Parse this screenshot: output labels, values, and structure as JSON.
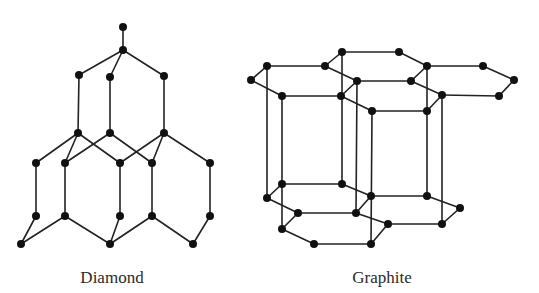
{
  "figure": {
    "colors": {
      "bond": "#222222",
      "atom": "#111111",
      "label": "#2a2a2a",
      "background": "#ffffff"
    },
    "atom_radius": 4,
    "panels": [
      {
        "id": "diamond",
        "label": "Diamond",
        "label_pos": [
          112,
          283
        ],
        "atoms": [
          [
            123,
            27
          ],
          [
            123,
            50
          ],
          [
            79,
            75
          ],
          [
            110,
            77
          ],
          [
            164,
            76
          ],
          [
            78,
            133
          ],
          [
            110,
            133
          ],
          [
            164,
            133
          ],
          [
            36,
            163
          ],
          [
            65,
            163
          ],
          [
            120,
            163
          ],
          [
            152,
            163
          ],
          [
            210,
            163
          ],
          [
            36,
            216
          ],
          [
            65,
            216
          ],
          [
            120,
            216
          ],
          [
            152,
            216
          ],
          [
            210,
            216
          ],
          [
            21,
            244
          ],
          [
            110,
            244
          ],
          [
            193,
            244
          ]
        ],
        "bonds": [
          [
            0,
            1
          ],
          [
            1,
            2
          ],
          [
            1,
            3
          ],
          [
            1,
            4
          ],
          [
            2,
            5
          ],
          [
            3,
            6
          ],
          [
            4,
            7
          ],
          [
            5,
            8
          ],
          [
            5,
            9
          ],
          [
            5,
            10
          ],
          [
            6,
            9
          ],
          [
            6,
            11
          ],
          [
            7,
            10
          ],
          [
            7,
            11
          ],
          [
            7,
            12
          ],
          [
            8,
            13
          ],
          [
            9,
            14
          ],
          [
            10,
            15
          ],
          [
            11,
            16
          ],
          [
            12,
            17
          ],
          [
            13,
            18
          ],
          [
            14,
            18
          ],
          [
            14,
            19
          ],
          [
            15,
            19
          ],
          [
            16,
            19
          ],
          [
            16,
            20
          ],
          [
            17,
            20
          ]
        ]
      },
      {
        "id": "graphite",
        "label": "Graphite",
        "label_pos": [
          382,
          283
        ],
        "atoms": [
          [
            251,
            80
          ],
          [
            267,
            66
          ],
          [
            325,
            66
          ],
          [
            342,
            52
          ],
          [
            399,
            52
          ],
          [
            427,
            66
          ],
          [
            483,
            66
          ],
          [
            514,
            80
          ],
          [
            357,
            81
          ],
          [
            411,
            81
          ],
          [
            282,
            96
          ],
          [
            341,
            96
          ],
          [
            442,
            95
          ],
          [
            499,
            96
          ],
          [
            372,
            111
          ],
          [
            427,
            111
          ],
          [
            282,
            184
          ],
          [
            342,
            184
          ],
          [
            371,
            196
          ],
          [
            427,
            196
          ],
          [
            460,
            208
          ],
          [
            267,
            198
          ],
          [
            298,
            213
          ],
          [
            356,
            213
          ],
          [
            388,
            224
          ],
          [
            442,
            224
          ],
          [
            282,
            229
          ],
          [
            314,
            244
          ],
          [
            371,
            244
          ]
        ],
        "bonds": [
          [
            0,
            1
          ],
          [
            1,
            2
          ],
          [
            2,
            8
          ],
          [
            8,
            11
          ],
          [
            11,
            10
          ],
          [
            10,
            0
          ],
          [
            2,
            3
          ],
          [
            3,
            4
          ],
          [
            4,
            5
          ],
          [
            5,
            9
          ],
          [
            9,
            8
          ],
          [
            5,
            6
          ],
          [
            6,
            7
          ],
          [
            7,
            13
          ],
          [
            13,
            12
          ],
          [
            12,
            9
          ],
          [
            12,
            15
          ],
          [
            15,
            14
          ],
          [
            14,
            11
          ],
          [
            1,
            21
          ],
          [
            10,
            16
          ],
          [
            16,
            26
          ],
          [
            3,
            17
          ],
          [
            8,
            23
          ],
          [
            14,
            28
          ],
          [
            5,
            19
          ],
          [
            12,
            25
          ],
          [
            16,
            17
          ],
          [
            17,
            18
          ],
          [
            18,
            23
          ],
          [
            23,
            22
          ],
          [
            22,
            21
          ],
          [
            21,
            16
          ],
          [
            18,
            19
          ],
          [
            19,
            20
          ],
          [
            20,
            25
          ],
          [
            25,
            24
          ],
          [
            24,
            23
          ],
          [
            22,
            26
          ],
          [
            26,
            27
          ],
          [
            27,
            28
          ],
          [
            28,
            24
          ]
        ]
      }
    ]
  }
}
